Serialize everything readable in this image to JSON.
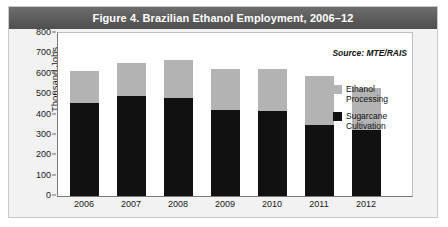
{
  "figure": {
    "title": "Figure 4. Brazilian Ethanol Employment, 2006–12",
    "source_note": "Source: MTE/RAIS",
    "title_bar_color": "#5a5a5a",
    "panel_color": "#f2f2f2",
    "plot_color": "#ffffff"
  },
  "chart_data": {
    "type": "bar",
    "stacked": true,
    "title": "Figure 4. Brazilian Ethanol Employment, 2006–12",
    "xlabel": "",
    "ylabel": "Thousand Jobs",
    "categories": [
      "2006",
      "2007",
      "2008",
      "2009",
      "2010",
      "2011",
      "2012"
    ],
    "series": [
      {
        "name": "Sugarcane Cultivation",
        "color": "#111111",
        "values": [
          458,
          493,
          480,
          420,
          415,
          350,
          322
        ]
      },
      {
        "name": "Ethanol Processing",
        "color": "#b3b3b3",
        "values": [
          157,
          162,
          190,
          205,
          210,
          240,
          210
        ]
      }
    ],
    "totals": [
      615,
      655,
      670,
      625,
      625,
      590,
      532
    ],
    "ylim": [
      0,
      800
    ],
    "ytick_values": [
      800,
      700,
      600,
      500,
      400,
      300,
      200,
      100,
      0
    ],
    "ytick_labels": [
      "800",
      "700",
      "600",
      "500",
      "400",
      "300",
      "200",
      "100",
      "0"
    ],
    "grid": false,
    "legend_position": "right-inside",
    "annotations": [
      "Source: MTE/RAIS"
    ]
  },
  "legend": {
    "items": [
      {
        "label_line1": "Ethanol",
        "label_line2": "Processing",
        "color": "#b3b3b3"
      },
      {
        "label_line1": "Sugarcane",
        "label_line2": "Cultivation",
        "color": "#111111"
      }
    ]
  }
}
